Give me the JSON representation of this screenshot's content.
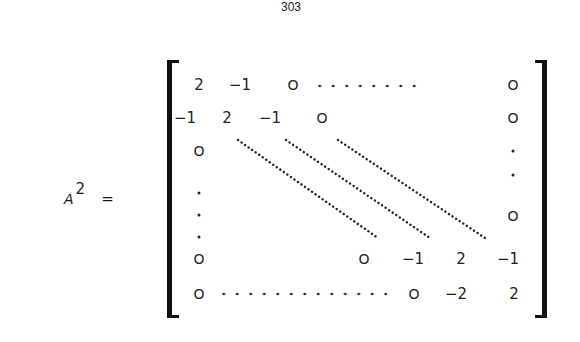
{
  "page": {
    "number": "303"
  },
  "equation": {
    "variable": "A",
    "exponent": "2",
    "equals": "="
  },
  "matrix": {
    "description": "Tridiagonal matrix A^2 with 2 on diagonal, -1 on off-diagonals, last row ends with -2, 2",
    "row1": [
      "2",
      "−1",
      "O",
      "…",
      "O"
    ],
    "row2": [
      "−1",
      "2",
      "−1",
      "O",
      "O"
    ],
    "row_second_last": [
      "O",
      "O",
      "−1",
      "2",
      "−1"
    ],
    "row_last": [
      "O",
      "…",
      "O",
      "−2",
      "2"
    ],
    "first_column_middle": [
      "O",
      "·",
      "·",
      "·"
    ],
    "last_column_middle": [
      "·",
      "·",
      "O"
    ],
    "labels": {
      "r1c1": "2",
      "r1c2": "−1",
      "r1c3": "O",
      "r1cn": "O",
      "r2c1": "−1",
      "r2c2": "2",
      "r2c3": "−1",
      "r2c4": "O",
      "r2cn": "O",
      "r3c1": "O",
      "rn1c1": "O",
      "rn1cx": "O",
      "rn1a": "−1",
      "rn1b": "2",
      "rn1cn": "−1",
      "rnc1": "O",
      "rncx": "O",
      "rna": "−2",
      "rncn": "2",
      "rcn_mid": "O"
    }
  }
}
